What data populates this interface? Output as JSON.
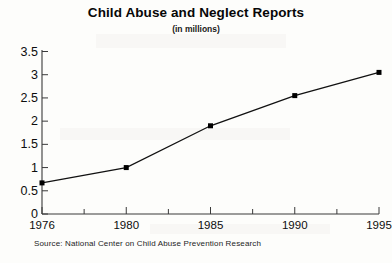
{
  "chart_data": {
    "type": "line",
    "title": "Child Abuse and Neglect Reports",
    "subtitle": "(in millions)",
    "xlabel": "",
    "ylabel": "",
    "categories": [
      "1976",
      "1980",
      "1985",
      "1990",
      "1995"
    ],
    "x": [
      1976,
      1980,
      1985,
      1990,
      1995
    ],
    "values": [
      0.67,
      1.0,
      1.9,
      2.55,
      3.05
    ],
    "series": [
      {
        "name": "Child abuse and neglect reports",
        "values": [
          0.67,
          1.0,
          1.9,
          2.55,
          3.05
        ]
      }
    ],
    "ylim": [
      0,
      3.5
    ],
    "y_ticks": [
      "0",
      "0.5",
      "1",
      "1.5",
      "2",
      "2.5",
      "3",
      "3.5"
    ],
    "y_tick_values": [
      0,
      0.5,
      1,
      1.5,
      2,
      2.5,
      3,
      3.5
    ],
    "x_tick_labels": [
      "1976",
      "1980",
      "1985",
      "1990",
      "1995"
    ],
    "grid": false,
    "legend": false,
    "marker": "square",
    "line_color": "#111111",
    "marker_color": "#000000",
    "axis_color": "#3a3a3a",
    "background": "#fdfdfb",
    "annotations": [],
    "source": "Source: National Center on Child Abuse Prevention Research"
  },
  "footer": {
    "source_text": "Source: National Center on Child Abuse Prevention Research"
  }
}
